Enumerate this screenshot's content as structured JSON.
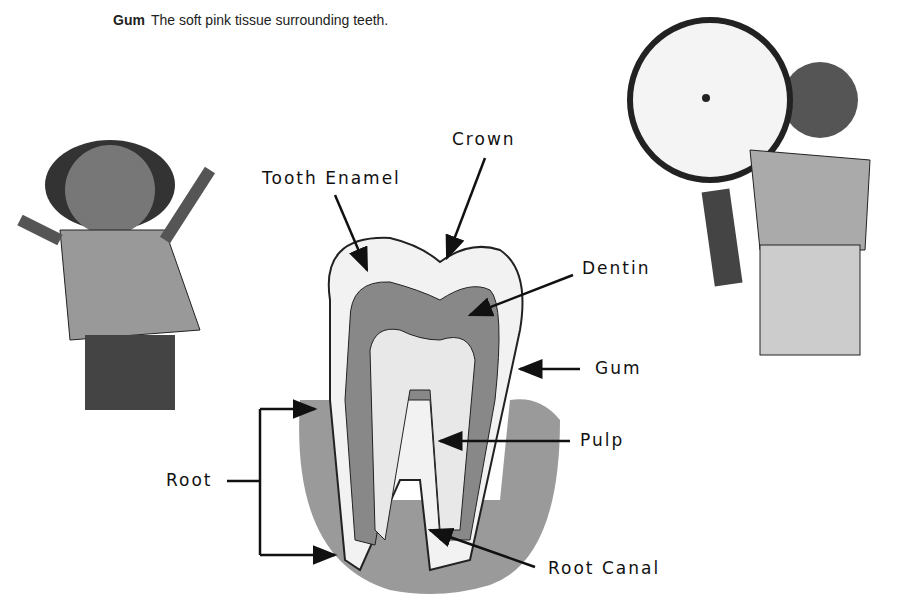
{
  "caption": {
    "term": "Gum",
    "definition": "The soft pink tissue surrounding teeth."
  },
  "labels": {
    "crown": "Crown",
    "tooth_enamel": "Tooth Enamel",
    "dentin": "Dentin",
    "gum": "Gum",
    "pulp": "Pulp",
    "root": "Root",
    "root_canal": "Root Canal"
  }
}
